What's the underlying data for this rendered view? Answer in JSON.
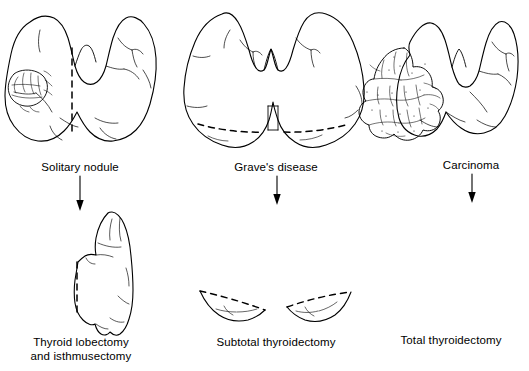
{
  "figure": {
    "background_color": "#ffffff",
    "ink_color": "#000000",
    "width": 529,
    "height": 371
  },
  "columns": [
    {
      "id": "solitary-nodule",
      "condition_label": "Solitary nodule",
      "procedure_label": "Thyroid lobectomy",
      "procedure_label_line2": "and isthmusectomy",
      "condition_specimen": "whole-thyroid-gland-with-solitary-nodule",
      "procedure_specimen": "single-thyroid-lobe-remnant",
      "resection_line_style": "dashed",
      "arrow": "down-arrow"
    },
    {
      "id": "graves-disease",
      "condition_label": "Grave's disease",
      "procedure_label": "Subtotal thyroidectomy",
      "procedure_label_line2": "",
      "condition_specimen": "diffusely-enlarged-thyroid-gland",
      "procedure_specimen": "two-posterior-lobe-remnants",
      "resection_line_style": "dashed",
      "arrow": "down-arrow"
    },
    {
      "id": "carcinoma",
      "condition_label": "Carcinoma",
      "procedure_label": "Total thyroidectomy",
      "procedure_label_line2": "",
      "condition_specimen": "thyroid-gland-with-lobulated-tumor-mass",
      "procedure_specimen": "no-remnant-tissue",
      "resection_line_style": "none",
      "arrow": "down-arrow"
    }
  ],
  "label_positions": {
    "condition_y": 167,
    "procedure_y": 341,
    "column_centers": [
      80,
      270,
      447
    ]
  }
}
